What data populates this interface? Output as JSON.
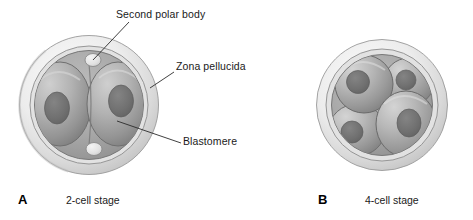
{
  "figure": {
    "type": "biological-diagram",
    "background_color": "#ffffff"
  },
  "annotations": [
    {
      "id": "second-polar-body",
      "label": "Second polar body",
      "text_x": 116,
      "text_y": 8,
      "leader": {
        "x1": 129,
        "y1": 22,
        "x2": 93,
        "y2": 60
      }
    },
    {
      "id": "zona-pellucida",
      "label": "Zona pellucida",
      "text_x": 176,
      "text_y": 60,
      "leader": {
        "x1": 174,
        "y1": 72,
        "x2": 150,
        "y2": 88
      }
    },
    {
      "id": "blastomere",
      "label": "Blastomere",
      "text_x": 183,
      "text_y": 135,
      "leader": {
        "x1": 181,
        "y1": 143,
        "x2": 117,
        "y2": 121
      }
    }
  ],
  "panels": [
    {
      "id": "panel-a",
      "letter": "A",
      "caption": "2-cell stage",
      "letter_x": 18,
      "letter_y": 196,
      "caption_x": 66,
      "caption_y": 199,
      "embryo": {
        "cx": 89,
        "cy": 105,
        "zona_outer_r": 70,
        "zona_inner_r": 60,
        "cytoplasm_r": 54,
        "cell_count": 2
      }
    },
    {
      "id": "panel-b",
      "letter": "B",
      "caption": "4-cell stage",
      "letter_x": 318,
      "letter_y": 196,
      "caption_x": 365,
      "caption_y": 199,
      "embryo": {
        "cx": 382,
        "cy": 105,
        "zona_outer_r": 66,
        "zona_inner_r": 56,
        "cytoplasm_r": 50,
        "cell_count": 4
      }
    }
  ],
  "colors": {
    "outline": "#6e6e6e",
    "zona_light": "#f0f0f0",
    "zona_mid": "#d8d8d8",
    "zona_shadow": "#c4c4c4",
    "perivitelline": "#a8a8a8",
    "blastomere_light": "#c2c2c2",
    "blastomere_mid": "#9d9d9d",
    "blastomere_dark": "#7c7c7c",
    "nucleus": "#6f6f6f",
    "polar_body": "#e8e8e8",
    "text": "#1a1a1a",
    "leader_line": "#2b2b2b"
  }
}
